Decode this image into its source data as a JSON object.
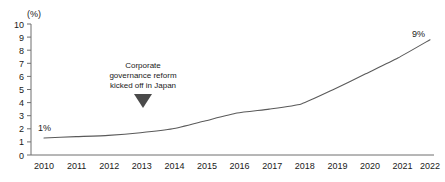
{
  "chart_data": {
    "type": "line",
    "title": "",
    "subtitle": "",
    "xlabel": "",
    "ylabel": "",
    "yunit": "(%)",
    "categories": [
      "2010",
      "2011",
      "2012",
      "2013",
      "2014",
      "2015",
      "2016",
      "2017",
      "2018",
      "2019",
      "2020",
      "2021",
      "2022"
    ],
    "x": [
      2010,
      2011,
      2012,
      2013,
      2014,
      2015,
      2016,
      2017,
      2018,
      2019,
      2020,
      2021,
      2022
    ],
    "values": [
      1.3,
      1.4,
      1.5,
      1.7,
      2.0,
      2.6,
      3.2,
      3.5,
      3.9,
      5.0,
      6.2,
      7.4,
      8.8
    ],
    "series": [
      {
        "name": "",
        "values": [
          1.3,
          1.4,
          1.5,
          1.7,
          2.0,
          2.6,
          3.2,
          3.5,
          3.9,
          5.0,
          6.2,
          7.4,
          8.8
        ]
      }
    ],
    "ylim": [
      0,
      10
    ],
    "yticks": [
      0,
      1,
      2,
      3,
      4,
      5,
      6,
      7,
      8,
      9,
      10
    ],
    "ytick_labels": [
      "0",
      "1",
      "2",
      "3",
      "4",
      "5",
      "6",
      "7",
      "8",
      "9",
      "10"
    ],
    "xlim": [
      2010,
      2022
    ],
    "grid": false,
    "legend": false,
    "legend_position": "none",
    "line_color": "#5a5a5a",
    "axis_color": "#6e6e6e",
    "text_color": "#1a1a1a",
    "annotations": [
      {
        "name": "start-value-label",
        "text": "1%",
        "x": 2010,
        "y": 1.3
      },
      {
        "name": "end-value-label",
        "text": "9%",
        "x": 2022,
        "y": 8.8
      },
      {
        "name": "reform-callout",
        "lines": [
          "Corporate",
          "governance reform",
          "kicked off in Japan"
        ],
        "marker": "down-triangle",
        "x": 2013,
        "y": 2.6
      }
    ]
  }
}
